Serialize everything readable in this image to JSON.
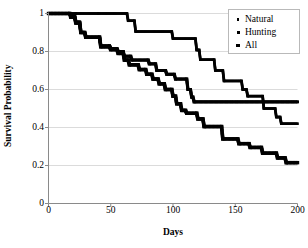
{
  "figure": {
    "title": "",
    "axis_title_y": "Survival Probability",
    "axis_title_x": "Days"
  },
  "legend": {
    "entries": [
      {
        "label": "Natural",
        "marker": "small-square-marker"
      },
      {
        "label": "Hunting",
        "marker": "medium-square-marker"
      },
      {
        "label": "All",
        "marker": "large-triangle-marker"
      }
    ]
  },
  "chart_data": {
    "type": "line",
    "title": "",
    "xlabel": "Days",
    "ylabel": "Survival Probability",
    "xlim": [
      0,
      200
    ],
    "ylim": [
      0,
      1
    ],
    "xticks": [
      0,
      50,
      100,
      150,
      200
    ],
    "yticks": [
      0,
      0.2,
      0.4,
      0.6,
      0.8,
      1
    ],
    "grid": "horizontal",
    "legend_position": "top-right",
    "style": "kaplan-meier step curves, black square markers",
    "series": [
      {
        "name": "Natural",
        "points": [
          [
            0,
            1.0
          ],
          [
            18,
            1.0
          ],
          [
            22,
            1.0
          ],
          [
            40,
            1.0
          ],
          [
            63,
            1.0
          ],
          [
            64,
            0.962
          ],
          [
            69,
            0.962
          ],
          [
            70,
            0.905
          ],
          [
            99,
            0.905
          ],
          [
            100,
            0.868
          ],
          [
            118,
            0.868
          ],
          [
            119,
            0.808
          ],
          [
            121,
            0.808
          ],
          [
            122,
            0.757
          ],
          [
            133,
            0.757
          ],
          [
            134,
            0.7
          ],
          [
            140,
            0.7
          ],
          [
            141,
            0.645
          ],
          [
            155,
            0.645
          ],
          [
            156,
            0.6
          ],
          [
            159,
            0.6
          ],
          [
            160,
            0.565
          ],
          [
            172,
            0.565
          ],
          [
            173,
            0.5
          ],
          [
            182,
            0.5
          ],
          [
            183,
            0.455
          ],
          [
            186,
            0.455
          ],
          [
            187,
            0.42
          ],
          [
            200,
            0.42
          ]
        ]
      },
      {
        "name": "Hunting",
        "points": [
          [
            0,
            1.0
          ],
          [
            17,
            1.0
          ],
          [
            18,
            0.985
          ],
          [
            21,
            0.985
          ],
          [
            22,
            0.955
          ],
          [
            25,
            0.955
          ],
          [
            26,
            0.9
          ],
          [
            29,
            0.9
          ],
          [
            30,
            0.875
          ],
          [
            41,
            0.875
          ],
          [
            42,
            0.83
          ],
          [
            49,
            0.83
          ],
          [
            50,
            0.815
          ],
          [
            55,
            0.815
          ],
          [
            56,
            0.8
          ],
          [
            60,
            0.8
          ],
          [
            61,
            0.775
          ],
          [
            66,
            0.775
          ],
          [
            67,
            0.755
          ],
          [
            80,
            0.755
          ],
          [
            81,
            0.735
          ],
          [
            86,
            0.735
          ],
          [
            87,
            0.7
          ],
          [
            94,
            0.7
          ],
          [
            95,
            0.68
          ],
          [
            101,
            0.68
          ],
          [
            102,
            0.655
          ],
          [
            111,
            0.655
          ],
          [
            112,
            0.6
          ],
          [
            114,
            0.6
          ],
          [
            115,
            0.56
          ],
          [
            116,
            0.56
          ],
          [
            117,
            0.535
          ],
          [
            200,
            0.535
          ]
        ]
      },
      {
        "name": "All",
        "points": [
          [
            0,
            1.0
          ],
          [
            17,
            1.0
          ],
          [
            18,
            0.98
          ],
          [
            21,
            0.98
          ],
          [
            22,
            0.95
          ],
          [
            25,
            0.95
          ],
          [
            26,
            0.9
          ],
          [
            29,
            0.9
          ],
          [
            30,
            0.875
          ],
          [
            41,
            0.875
          ],
          [
            42,
            0.825
          ],
          [
            49,
            0.825
          ],
          [
            50,
            0.81
          ],
          [
            55,
            0.81
          ],
          [
            56,
            0.79
          ],
          [
            60,
            0.79
          ],
          [
            61,
            0.755
          ],
          [
            64,
            0.755
          ],
          [
            65,
            0.73
          ],
          [
            72,
            0.73
          ],
          [
            73,
            0.705
          ],
          [
            78,
            0.705
          ],
          [
            79,
            0.68
          ],
          [
            83,
            0.68
          ],
          [
            84,
            0.655
          ],
          [
            88,
            0.655
          ],
          [
            89,
            0.63
          ],
          [
            93,
            0.63
          ],
          [
            94,
            0.6
          ],
          [
            99,
            0.6
          ],
          [
            100,
            0.565
          ],
          [
            102,
            0.565
          ],
          [
            103,
            0.525
          ],
          [
            106,
            0.525
          ],
          [
            107,
            0.49
          ],
          [
            110,
            0.49
          ],
          [
            111,
            0.475
          ],
          [
            119,
            0.475
          ],
          [
            120,
            0.445
          ],
          [
            124,
            0.445
          ],
          [
            125,
            0.405
          ],
          [
            139,
            0.405
          ],
          [
            140,
            0.34
          ],
          [
            152,
            0.34
          ],
          [
            153,
            0.315
          ],
          [
            161,
            0.315
          ],
          [
            162,
            0.295
          ],
          [
            171,
            0.295
          ],
          [
            172,
            0.265
          ],
          [
            183,
            0.265
          ],
          [
            184,
            0.24
          ],
          [
            190,
            0.24
          ],
          [
            191,
            0.215
          ],
          [
            200,
            0.215
          ]
        ]
      }
    ]
  }
}
